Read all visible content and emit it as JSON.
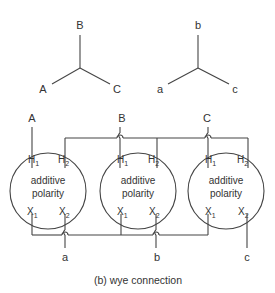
{
  "wye_primary": {
    "top": "B",
    "left": "A",
    "right": "C"
  },
  "wye_secondary": {
    "top": "b",
    "left": "a",
    "right": "c"
  },
  "transformers": [
    {
      "line_label": "A",
      "h1": "H",
      "h1_sub": "1",
      "h2": "H",
      "h2_sub": "2",
      "x1": "X",
      "x1_sub": "1",
      "x2": "X",
      "x2_sub": "2",
      "text1": "additive",
      "text2": "polarity",
      "out_label": "a"
    },
    {
      "line_label": "B",
      "h1": "H",
      "h1_sub": "1",
      "h2": "H",
      "h2_sub": "2",
      "x1": "X",
      "x1_sub": "1",
      "x2": "X",
      "x2_sub": "2",
      "text1": "additive",
      "text2": "polarity",
      "out_label": "b"
    },
    {
      "line_label": "C",
      "h1": "H",
      "h1_sub": "1",
      "h2": "H",
      "h2_sub": "2",
      "x1": "X",
      "x1_sub": "1",
      "x2": "X",
      "x2_sub": "2",
      "text1": "additive",
      "text2": "polarity",
      "out_label": "c"
    }
  ],
  "caption": "(b) wye connection"
}
